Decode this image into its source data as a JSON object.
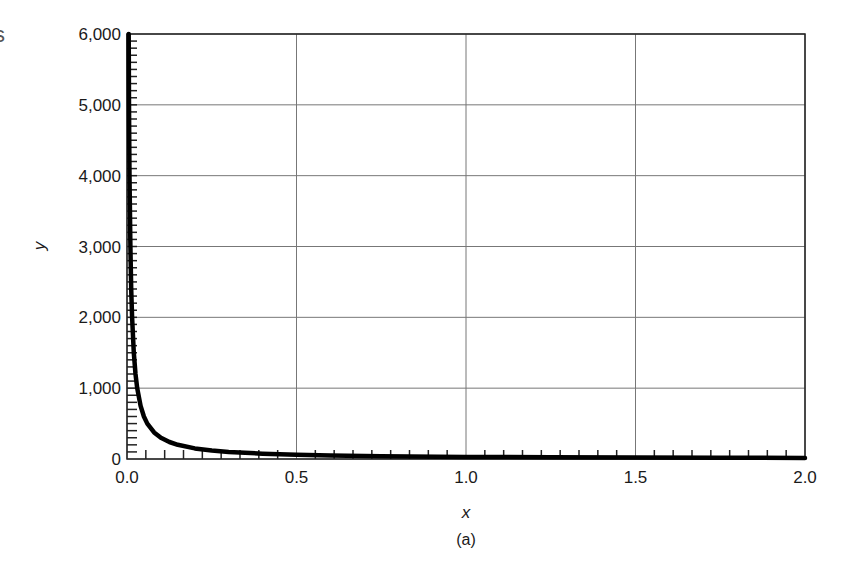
{
  "figure": {
    "caption": "(a)",
    "edge_fragment": "s"
  },
  "chart_data": {
    "type": "line",
    "title": "",
    "xlabel": "x",
    "ylabel": "y",
    "xlim": [
      0.0,
      2.0
    ],
    "ylim": [
      0,
      6000
    ],
    "x_ticks": [
      0.0,
      0.5,
      1.0,
      1.5,
      2.0
    ],
    "x_tick_labels": [
      "0.0",
      "0.5",
      "1.0",
      "1.5",
      "2.0"
    ],
    "y_ticks": [
      0,
      1000,
      2000,
      3000,
      4000,
      5000,
      6000
    ],
    "y_tick_labels": [
      "0",
      "1,000",
      "2,000",
      "3,000",
      "4,000",
      "5,000",
      "6,000"
    ],
    "x_minor_per_major": 9,
    "y_minor_step": 100,
    "grid": true,
    "legend": null,
    "series": [
      {
        "name": "y = 30/x",
        "color": "#000000",
        "x": [
          0.005,
          0.006,
          0.0075,
          0.01,
          0.0125,
          0.015,
          0.02,
          0.025,
          0.03,
          0.04,
          0.05,
          0.06,
          0.08,
          0.1,
          0.125,
          0.15,
          0.2,
          0.25,
          0.3,
          0.4,
          0.5,
          0.6,
          0.75,
          1.0,
          1.25,
          1.5,
          1.75,
          2.0
        ],
        "y": [
          6000,
          5000,
          4000,
          3000,
          2400,
          2000,
          1500,
          1200,
          1000,
          750,
          600,
          500,
          375,
          300,
          240,
          200,
          150,
          120,
          100,
          75,
          60,
          50,
          40,
          30,
          24,
          20,
          17,
          15
        ]
      }
    ]
  }
}
